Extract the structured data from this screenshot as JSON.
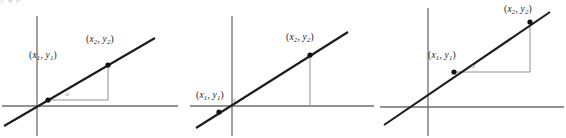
{
  "figure": {
    "clipped_caption_fragment": "y     g   p",
    "point_labels": {
      "p1_open": "(",
      "p1_x": "x",
      "p1_x_sub": "1",
      "p1_comma": ", ",
      "p1_y": "y",
      "p1_y_sub": "1",
      "p1_close": ")",
      "p2_open": "(",
      "p2_x": "x",
      "p2_x_sub": "2",
      "p2_comma": ", ",
      "p2_y": "y",
      "p2_y_sub": "2",
      "p2_close": ")"
    },
    "angle_label": "α",
    "colors": {
      "line": "#1c1c1c",
      "axis": "#6e6e6e",
      "construction": "#8f8f8f",
      "point": "#111111",
      "background": "#ffffff",
      "clipped_text": "#c9c9c9"
    },
    "panels": [
      {
        "id": "panel-1",
        "name": "slope-diagram-positive-both-points-above-axis",
        "x_offset": 0,
        "width": 190,
        "y_axis": {
          "x": 37,
          "y1": 16,
          "y2": 136
        },
        "x_axis": {
          "y": 106,
          "x1": 2,
          "x2": 178
        },
        "line": {
          "x1": 4,
          "y1": 126,
          "x2": 155,
          "y2": 38
        },
        "p1": {
          "x": 48,
          "y": 100
        },
        "p2": {
          "x": 108,
          "y": 65
        },
        "run": {
          "x1": 48,
          "y1": 100,
          "x2": 108,
          "y2": 100
        },
        "rise": {
          "x1": 108,
          "y1": 100,
          "x2": 108,
          "y2": 65
        },
        "p1_label": {
          "x": 43,
          "y": 58,
          "anchor": "middle"
        },
        "p2_label": {
          "x": 100,
          "y": 42,
          "anchor": "middle"
        },
        "angle": {
          "x": 67,
          "y": 96
        }
      },
      {
        "id": "panel-2",
        "name": "slope-diagram-first-point-on-x-axis",
        "x_offset": 188,
        "width": 190,
        "y_axis": {
          "x": 44,
          "y1": 16,
          "y2": 136
        },
        "x_axis": {
          "y": 106,
          "x1": 2,
          "x2": 186
        },
        "line": {
          "x1": 8,
          "y1": 128,
          "x2": 160,
          "y2": 32
        },
        "p1": {
          "x": 31,
          "y": 112
        },
        "p2": {
          "x": 122,
          "y": 55
        },
        "run": {
          "x1": 31,
          "y1": 106,
          "x2": 122,
          "y2": 106
        },
        "rise": {
          "x1": 122,
          "y1": 106,
          "x2": 122,
          "y2": 55
        },
        "p1_label": {
          "x": 22,
          "y": 98,
          "anchor": "middle"
        },
        "p2_label": {
          "x": 112,
          "y": 40,
          "anchor": "middle"
        },
        "angle": {
          "x": 46,
          "y": 102
        }
      },
      {
        "id": "panel-3",
        "name": "slope-diagram-steeper-line-clipped-top-label",
        "x_offset": 378,
        "width": 188,
        "y_axis": {
          "x": 50,
          "y1": 8,
          "y2": 136
        },
        "x_axis": {
          "y": 107,
          "x1": 2,
          "x2": 186
        },
        "line": {
          "x1": 6,
          "y1": 125,
          "x2": 172,
          "y2": 12
        },
        "p1": {
          "x": 76,
          "y": 72
        },
        "p2": {
          "x": 152,
          "y": 22
        },
        "run": {
          "x1": 76,
          "y1": 72,
          "x2": 152,
          "y2": 72
        },
        "rise": {
          "x1": 152,
          "y1": 72,
          "x2": 152,
          "y2": 22
        },
        "p1_label": {
          "x": 64,
          "y": 58,
          "anchor": "middle"
        },
        "p2_label": {
          "x": 140,
          "y": 12,
          "anchor": "middle"
        },
        "angle": {
          "x": 95,
          "y": 68
        }
      }
    ]
  }
}
